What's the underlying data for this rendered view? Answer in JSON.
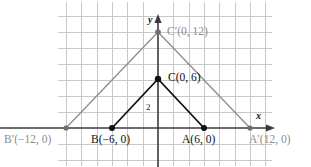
{
  "figure": {
    "background": "#ffffff",
    "grid": {
      "visible": true,
      "color": "#c9c9c9",
      "x_spacing_px": 15.3,
      "y_spacing_px": 16.0,
      "x_left_px": 58,
      "x_right_px": 272,
      "y_top_px": 2,
      "y_bottom_px": 166
    },
    "axes": {
      "x_label": "x",
      "y_label": "y",
      "axis_color": "#3a3a3a",
      "origin_px": {
        "x": 158,
        "y": 128
      },
      "x_arrow": "right",
      "y_arrow": "up"
    },
    "shapes": [
      {
        "name": "triangle-image-A'B'C'",
        "color": "#8d8d8d",
        "stroke_width": 1.2,
        "vertices": [
          {
            "label": "A'",
            "coords": "(12, 0)",
            "x": 12,
            "y": 0,
            "px": {
              "x": 250,
              "y": 128
            }
          },
          {
            "label": "B'",
            "coords": "(-12, 0)",
            "x": -12,
            "y": 0,
            "px": {
              "x": 66,
              "y": 128
            }
          },
          {
            "label": "C'",
            "coords": "(0, 12)",
            "x": 0,
            "y": 12,
            "px": {
              "x": 158,
              "y": 32
            }
          }
        ]
      },
      {
        "name": "triangle-preimage-ABC",
        "color": "#111111",
        "stroke_width": 1.6,
        "vertices": [
          {
            "label": "A",
            "coords": "(6, 0)",
            "x": 6,
            "y": 0,
            "px": {
              "x": 204,
              "y": 128
            }
          },
          {
            "label": "B",
            "coords": "(-6, 0)",
            "x": -6,
            "y": 0,
            "px": {
              "x": 112,
              "y": 128
            }
          },
          {
            "label": "C",
            "coords": "(0, 6)",
            "x": 0,
            "y": 6,
            "px": {
              "x": 158,
              "y": 79
            }
          }
        ]
      }
    ],
    "labels": {
      "c_prime": {
        "text": "C′(0, 12)",
        "color": "gray"
      },
      "c": {
        "text": "C(0, 6)",
        "color": "black"
      },
      "b_prime": {
        "text": "B′(−12, 0)",
        "color": "gray"
      },
      "b": {
        "text": "B(−6, 0)",
        "color": "black"
      },
      "a": {
        "text": "A(6, 0)",
        "color": "black"
      },
      "a_prime": {
        "text": "A′(12, 0)",
        "color": "gray"
      },
      "scale_mark": {
        "text": "2",
        "color": "black"
      },
      "x_axis": {
        "text": "x"
      },
      "y_axis": {
        "text": "y"
      }
    }
  }
}
